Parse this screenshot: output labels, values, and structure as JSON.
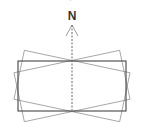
{
  "diagram": {
    "north_label": "N",
    "partial_top_text": "·",
    "colors": {
      "main_rect": "#444444",
      "rotated_rects": "#888888",
      "axis": "#555555",
      "background": "#ffffff"
    },
    "main_rectangle": {
      "x": 18,
      "y": 61,
      "width": 108,
      "height": 50
    },
    "rotation_center": {
      "x": 72,
      "y": 86
    },
    "rotated_rectangles": [
      {
        "angle_deg": 12
      },
      {
        "angle_deg": -12
      }
    ]
  }
}
